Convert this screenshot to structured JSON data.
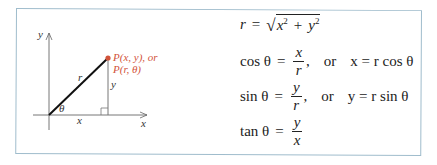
{
  "figure": {
    "border_color": "#9fbccc",
    "diagram": {
      "axis_labels": {
        "x": "x",
        "y": "y"
      },
      "segment_labels": {
        "hypotenuse": "r",
        "horizontal": "x",
        "vertical": "y",
        "angle": "θ"
      },
      "point": {
        "color": "#d2533a",
        "label_line1": "P(x, y), or",
        "label_line2": "P(r, θ)"
      }
    },
    "equations": {
      "r_def": {
        "lhs": "r",
        "eq": "=",
        "radicand_x": "x",
        "sq": "2",
        "plus": "+",
        "radicand_y": "y"
      },
      "cos": {
        "fn": "cos θ",
        "eq": "=",
        "num": "x",
        "den": "r",
        "comma": ",",
        "or": "or",
        "alt": "x = r cos θ"
      },
      "sin": {
        "fn": "sin θ",
        "eq": "=",
        "num": "y",
        "den": "r",
        "comma": ",",
        "or": "or",
        "alt": "y = r sin θ"
      },
      "tan": {
        "fn": "tan θ",
        "eq": "=",
        "num": "y",
        "den": "x"
      }
    }
  }
}
